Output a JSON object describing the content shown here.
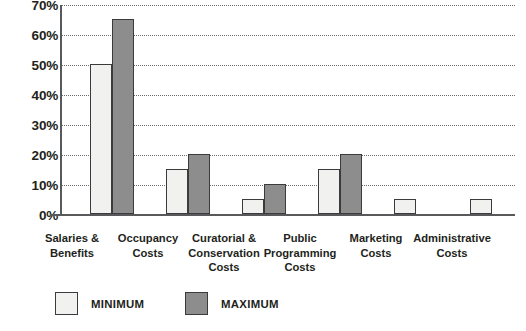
{
  "chart_data": {
    "type": "bar",
    "title": "",
    "subtitle": "",
    "xlabel": "",
    "ylabel": "",
    "ylim": [
      0,
      70
    ],
    "ytick_labels": [
      "0%",
      "10%",
      "20%",
      "30%",
      "40%",
      "50%",
      "60%",
      "70%"
    ],
    "ytick_values": [
      0,
      10,
      20,
      30,
      40,
      50,
      60,
      70
    ],
    "grid": true,
    "legend_position": "bottom-left",
    "categories": [
      "Salaries & Benefits",
      "Occupancy Costs",
      "Curatorial & Conservation Costs",
      "Public Programming Costs",
      "Marketing Costs",
      "Administrative Costs"
    ],
    "category_lines": [
      [
        "Salaries &",
        "Benefits"
      ],
      [
        "Occupancy",
        "Costs"
      ],
      [
        "Curatorial &",
        "Conservation",
        "Costs"
      ],
      [
        "Public",
        "Programming",
        "Costs"
      ],
      [
        "Marketing",
        "Costs"
      ],
      [
        "Administrative",
        "Costs"
      ]
    ],
    "series": [
      {
        "name": "MINIMUM",
        "color": "#f1f1ef",
        "values": [
          50,
          15,
          5,
          15,
          5,
          5
        ]
      },
      {
        "name": "MAXIMUM",
        "color": "#8d8d8d",
        "values": [
          65,
          20,
          10,
          20,
          null,
          null
        ]
      }
    ]
  },
  "legend": {
    "items": [
      {
        "label": "MINIMUM",
        "swatch": "minimum-swatch"
      },
      {
        "label": "MAXIMUM",
        "swatch": "maximum-swatch"
      }
    ]
  },
  "colors": {
    "minimum_fill": "#f1f1ef",
    "maximum_fill": "#8d8d8d",
    "bar_outline": "#3b3b3d",
    "axis": "#58595b",
    "gridline": "#6d6e71",
    "text": "#231f20",
    "background": "#ffffff"
  }
}
